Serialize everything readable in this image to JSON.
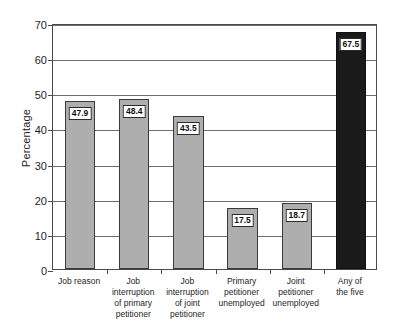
{
  "chart_data": {
    "type": "bar",
    "title": "",
    "xlabel": "",
    "ylabel": "Percentage",
    "ylim": [
      0,
      70
    ],
    "yticks": [
      0,
      10,
      20,
      30,
      40,
      50,
      60,
      70
    ],
    "grid": true,
    "legend": "none",
    "categories": [
      "Job reason",
      "Job interruption of primary petitioner",
      "Job interruption of joint petitioner",
      "Primary petitioner unemployed",
      "Joint petitioner unemployed",
      "Any of the five"
    ],
    "category_lines": [
      [
        "Job reason"
      ],
      [
        "Job",
        "interruption",
        "of primary",
        "petitioner"
      ],
      [
        "Job",
        "interruption",
        "of joint",
        "petitioner"
      ],
      [
        "Primary",
        "petitioner",
        "unemployed"
      ],
      [
        "Joint",
        "petitioner",
        "unemployed"
      ],
      [
        "Any of",
        "the five"
      ]
    ],
    "values": [
      47.9,
      48.4,
      43.5,
      17.5,
      18.7,
      67.5
    ],
    "value_labels": [
      "47.9",
      "48.4",
      "43.5",
      "17.5",
      "18.7",
      "67.5"
    ],
    "bar_colors": [
      "#aeaeae",
      "#aeaeae",
      "#aeaeae",
      "#aeaeae",
      "#aeaeae",
      "#1a1a1a"
    ],
    "ytick_labels": [
      "0",
      "10",
      "20",
      "30",
      "40",
      "50",
      "60",
      "70"
    ]
  },
  "colors": {
    "bar_grey": "#aeaeae",
    "bar_dark": "#1a1a1a",
    "axis": "#4a4a4a",
    "grid": "#6e6e6e",
    "background": "#ffffff",
    "text": "#1e1e1e"
  }
}
